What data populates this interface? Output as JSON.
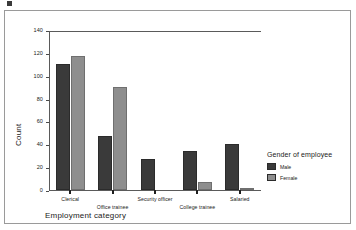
{
  "chart_data": {
    "type": "bar",
    "title": "",
    "xlabel": "Employment category",
    "ylabel": "Count",
    "categories": [
      "Clerical",
      "Office trainee",
      "Security officer",
      "College trainee",
      "Salaried"
    ],
    "series": [
      {
        "name": "Male",
        "color": "#3a3a3a",
        "values": [
          110,
          47,
          27,
          34,
          40
        ]
      },
      {
        "name": "Female",
        "color": "#8e8e8e",
        "values": [
          117,
          90,
          0,
          7,
          2
        ]
      }
    ],
    "ylim": [
      0,
      140
    ],
    "yticks": [
      0,
      20,
      40,
      60,
      80,
      100,
      120,
      140
    ],
    "grid": false,
    "legend": {
      "title": "Gender of employee",
      "position": "right",
      "entries": [
        {
          "label": "Male",
          "color": "#3a3a3a"
        },
        {
          "label": "Female",
          "color": "#8e8e8e"
        }
      ]
    }
  },
  "figure": {
    "background": "#ffffff",
    "frame_color": "#9a9a9a",
    "axis_color": "#5a5a5a"
  }
}
